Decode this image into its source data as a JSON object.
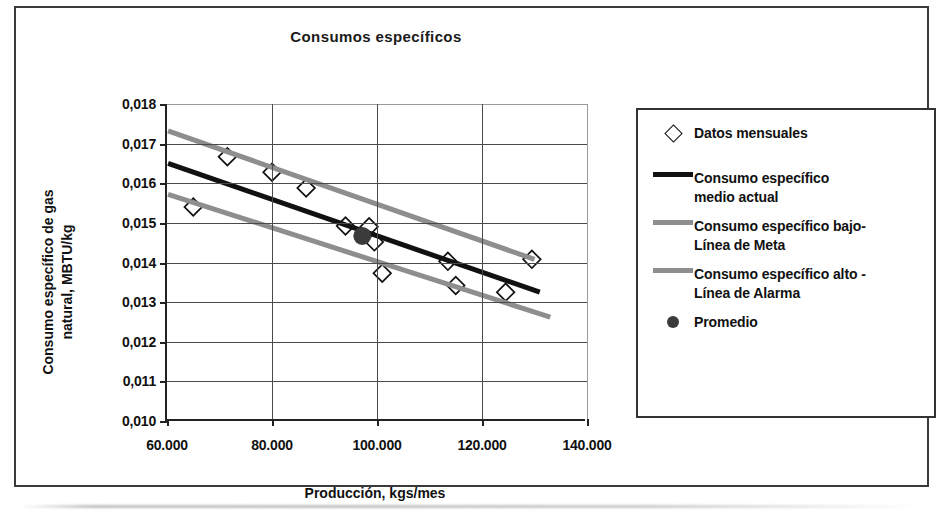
{
  "chart_data": {
    "type": "scatter",
    "title": "Consumos específicos",
    "xlabel": "Producción, kgs/mes",
    "ylabel": "Consumo específico de gas natural, MBTU/kg",
    "ylabel_line1": "Consumo específico de gas",
    "ylabel_line2": "natural, MBTU/kg",
    "xlim": [
      60000,
      140000
    ],
    "ylim": [
      0.01,
      0.018
    ],
    "xticks": [
      60000,
      80000,
      100000,
      120000,
      140000
    ],
    "xtick_labels": [
      "60.000",
      "80.000",
      "100.000",
      "120.000",
      "140.000"
    ],
    "yticks": [
      0.01,
      0.011,
      0.012,
      0.013,
      0.014,
      0.015,
      0.016,
      0.017,
      0.018
    ],
    "ytick_labels": [
      "0,010",
      "0,011",
      "0,012",
      "0,013",
      "0,014",
      "0,015",
      "0,016",
      "0,017",
      "0,018"
    ],
    "grid": true,
    "legend_position": "right",
    "series": [
      {
        "name": "Datos mensuales",
        "type": "scatter",
        "marker": "open-diamond",
        "color": "#111111",
        "points": [
          {
            "x": 65000,
            "y": 0.0154
          },
          {
            "x": 71500,
            "y": 0.01667
          },
          {
            "x": 80000,
            "y": 0.01628
          },
          {
            "x": 86500,
            "y": 0.01588
          },
          {
            "x": 94000,
            "y": 0.01492
          },
          {
            "x": 98500,
            "y": 0.0149
          },
          {
            "x": 99500,
            "y": 0.01452
          },
          {
            "x": 101000,
            "y": 0.01373
          },
          {
            "x": 113500,
            "y": 0.01403
          },
          {
            "x": 115000,
            "y": 0.01342
          },
          {
            "x": 124500,
            "y": 0.01325
          },
          {
            "x": 129500,
            "y": 0.01408
          }
        ]
      },
      {
        "name": "Consumo específico medio actual",
        "type": "line",
        "color": "#111111",
        "width": 5,
        "points": [
          {
            "x": 60200,
            "y": 0.0165
          },
          {
            "x": 131000,
            "y": 0.01325
          }
        ]
      },
      {
        "name": "Consumo específico bajo-Línea de Meta",
        "type": "line",
        "color": "#8e8e8e",
        "width": 5,
        "points": [
          {
            "x": 60200,
            "y": 0.01572
          },
          {
            "x": 133000,
            "y": 0.01262
          }
        ]
      },
      {
        "name": "Consumo específico alto -Línea de Alarma",
        "type": "line",
        "color": "#8e8e8e",
        "width": 5,
        "points": [
          {
            "x": 60200,
            "y": 0.01732
          },
          {
            "x": 130000,
            "y": 0.01408
          }
        ]
      },
      {
        "name": "Promedio",
        "type": "scatter",
        "marker": "filled-circle",
        "color": "#3b3b3b",
        "points": [
          {
            "x": 97200,
            "y": 0.01467
          }
        ]
      }
    ]
  },
  "legend": {
    "items": [
      {
        "label": "Datos mensuales",
        "key": "open-diamond",
        "color": "#111111"
      },
      {
        "label": "Consumo específico medio actual",
        "key": "line",
        "color": "#111111"
      },
      {
        "label": "Consumo específico bajo-Línea de Meta",
        "key": "line",
        "color": "#8e8e8e"
      },
      {
        "label": "Consumo específico alto -Línea de Alarma",
        "key": "line",
        "color": "#8e8e8e"
      },
      {
        "label": "Promedio",
        "key": "filled-circle",
        "color": "#3b3b3b"
      }
    ],
    "item_lines": [
      [
        "Datos mensuales"
      ],
      [
        "Consumo específico",
        "medio actual"
      ],
      [
        "Consumo específico bajo-",
        "Línea de Meta"
      ],
      [
        "Consumo específico alto -",
        "Línea de Alarma"
      ],
      [
        "Promedio"
      ]
    ]
  },
  "colors": {
    "axis": "#222222",
    "grid": "#4a4a4a",
    "series_dark": "#111111",
    "series_gray": "#8e8e8e",
    "average": "#3b3b3b",
    "frame": "#3a3a3a"
  }
}
